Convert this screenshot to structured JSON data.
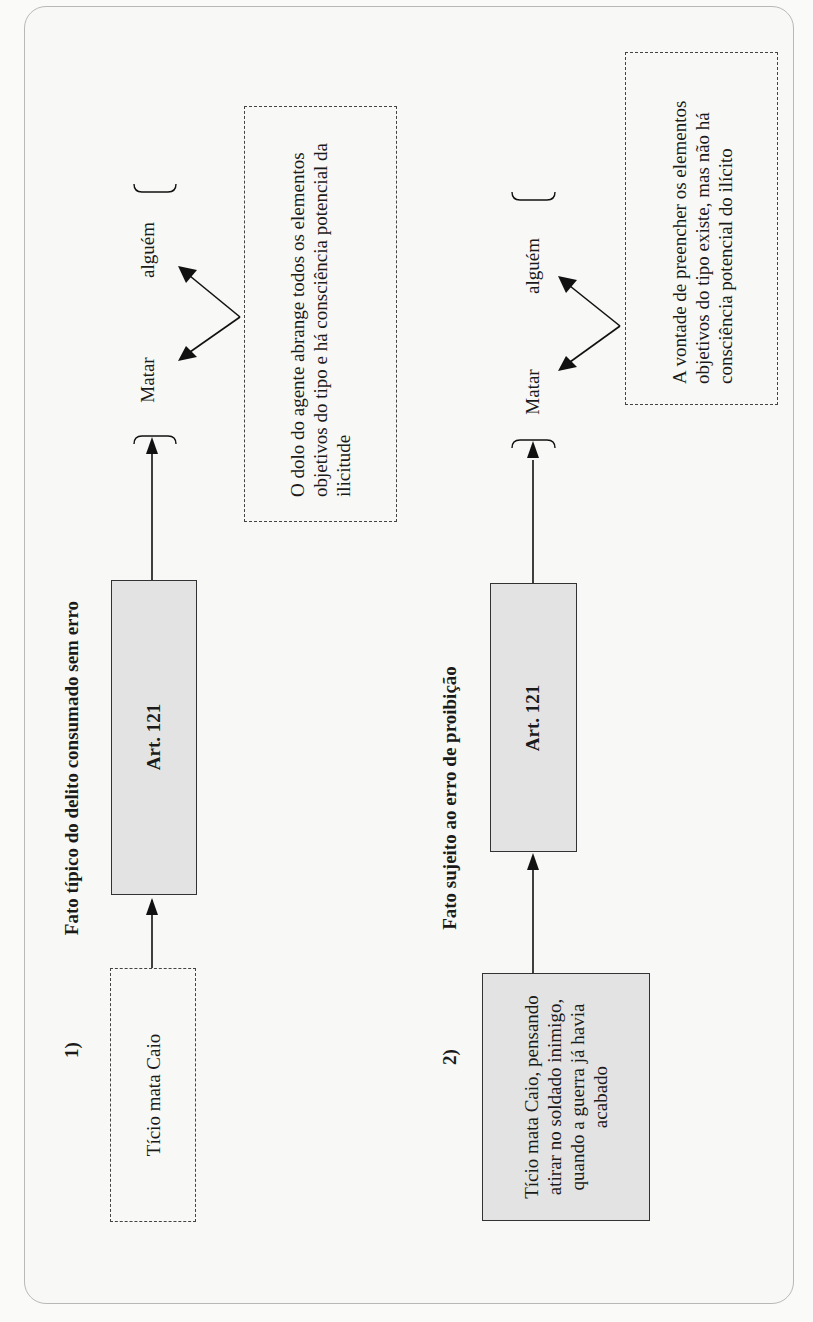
{
  "orientation": "rotated-90-ccw",
  "sections": [
    {
      "number": "1)",
      "heading": "Fato típico do delito consumado sem erro",
      "fact_box": {
        "text": "Tício mata Caio",
        "style": "dashed"
      },
      "article_box": {
        "label": "Art. 121"
      },
      "elements": {
        "bracket_terms": [
          "Matar",
          "alguém"
        ]
      },
      "note": {
        "text": "O dolo do agente abrange todos os elementos objetivos do tipo e há consciência potencial da ilicitude",
        "style": "dashed"
      }
    },
    {
      "number": "2)",
      "heading": "Fato sujeito ao erro de proibição",
      "fact_box": {
        "text": "Tício mata Caio, pensando atirar no soldado inimigo, quando a guerra já havia acabado",
        "style": "gray-filled"
      },
      "article_box": {
        "label": "Art. 121"
      },
      "elements": {
        "bracket_terms": [
          "Matar",
          "alguém"
        ]
      },
      "note": {
        "text": "A vontade de preencher os elementos objetivos do tipo existe, mas não há consciência potencial do ilícito",
        "style": "dashed"
      }
    }
  ],
  "colors": {
    "box_fill": "#e3e3e3",
    "stroke": "#1a1a1a",
    "frame_border": "#b8b8b8",
    "background": "#f8f8f6"
  }
}
